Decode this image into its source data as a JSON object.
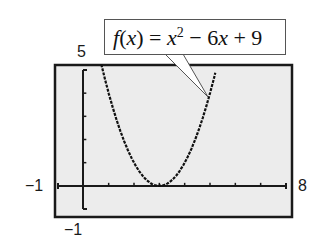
{
  "chart_data": {
    "type": "line",
    "function": "x^2 - 6x + 9",
    "xlabel": "",
    "ylabel": "",
    "xlim": [
      -1,
      8
    ],
    "ylim": [
      -1,
      5
    ],
    "grid": false,
    "x_ticks_step": 1,
    "y_ticks_step": 1,
    "tick_labels": {
      "xmin": "-1",
      "xmax": "8",
      "ymin": "-1",
      "ymax": "5"
    },
    "series": [
      {
        "name": "f(x) = x^2 - 6x + 9",
        "x": [
          0.71,
          1,
          1.5,
          2,
          2.5,
          3,
          3.5,
          4,
          4.5,
          5,
          5.24
        ],
        "y": [
          5.24,
          4,
          2.25,
          1,
          0.25,
          0,
          0.25,
          1,
          2.25,
          4,
          5.02
        ]
      }
    ],
    "annotations": [
      {
        "text": "f(x) = x² − 6x + 9",
        "points_to": [
          4.85,
          3.4
        ]
      }
    ]
  },
  "labels": {
    "ymax": "5",
    "ymin": "−1",
    "xmin": "−1",
    "xmax": "8"
  },
  "callout": {
    "f": "f",
    "paren_open": "(",
    "x1": "x",
    "eq": ") = ",
    "x2": "x",
    "exp": "2",
    "rest_pre": " − 6",
    "x3": "x",
    "rest_post": " + 9"
  }
}
